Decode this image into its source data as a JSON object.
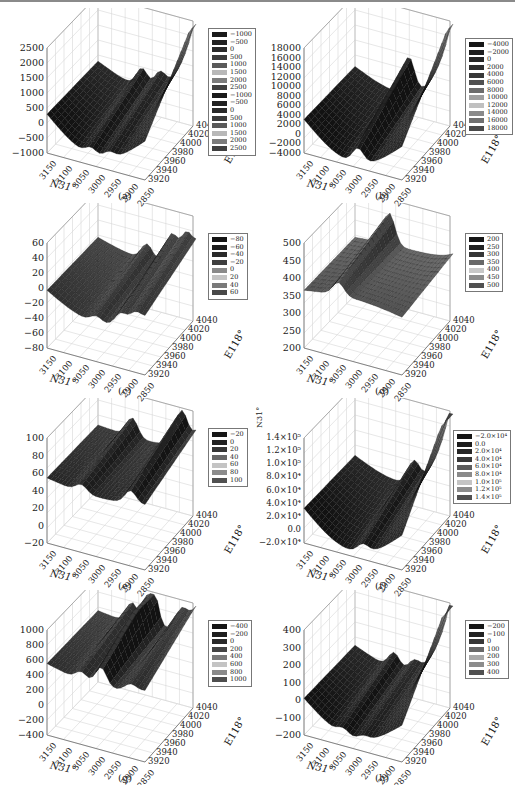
{
  "chart_data": [
    {
      "id": "a",
      "type": "surface3d",
      "caption": "(a)",
      "xlabel": "N31°",
      "ylabel": "E118°",
      "x_ticks": [
        "3150",
        "3100",
        "3050",
        "3000",
        "2950",
        "2900",
        "2850"
      ],
      "y_ticks": [
        "3920",
        "3940",
        "3960",
        "3980",
        "4000",
        "4020",
        "4040"
      ],
      "z_ticks": [
        "2500",
        "2000",
        "1500",
        "1000",
        "500",
        "0",
        "−500",
        "−1000"
      ],
      "zlim": [
        -1000,
        2500
      ],
      "legend": [
        "−1000",
        "−500",
        "0",
        "500",
        "1000",
        "1500",
        "2000",
        "2500",
        "−1000",
        "−500",
        "0",
        "500",
        "1000",
        "1500",
        "2000",
        "2500"
      ],
      "legend_colors": [
        "#1a1a1a",
        "#222222",
        "#2a2a2a",
        "#3c3c3c",
        "#5a5a5a",
        "#b8b8b8",
        "#7c7c7c",
        "#404040",
        "#1a1a1a",
        "#222222",
        "#2a2a2a",
        "#3c3c3c",
        "#5a5a5a",
        "#b8b8b8",
        "#7c7c7c",
        "#404040"
      ],
      "grid": true
    },
    {
      "id": "b",
      "type": "surface3d",
      "caption": "(b)",
      "xlabel": "N31°",
      "ylabel": "E118°",
      "x_ticks": [
        "3150",
        "3100",
        "3050",
        "3000",
        "2950",
        "2900",
        "2850"
      ],
      "y_ticks": [
        "3920",
        "3940",
        "3960",
        "3980",
        "4000",
        "4020",
        "4040"
      ],
      "z_ticks": [
        "18000",
        "16000",
        "14000",
        "12000",
        "10000",
        "8000",
        "6000",
        "4000",
        "2000",
        "0",
        "−2000",
        "−4000"
      ],
      "zlim": [
        -4000,
        18000
      ],
      "legend": [
        "−4000",
        "−2000",
        "0",
        "2000",
        "4000",
        "6000",
        "8000",
        "10000",
        "12000",
        "14000",
        "16000",
        "18000"
      ],
      "legend_colors": [
        "#161616",
        "#1e1e1e",
        "#262626",
        "#2e2e2e",
        "#383838",
        "#505050",
        "#6c6c6c",
        "#a0a0a0",
        "#c0c0c0",
        "#8a8a8a",
        "#707070",
        "#4a4a4a"
      ],
      "grid": true
    },
    {
      "id": "c",
      "type": "surface3d",
      "caption": "(c)",
      "xlabel": "N31°",
      "ylabel": "E118°",
      "x_ticks": [
        "3150",
        "3100",
        "3050",
        "3000",
        "2950",
        "2900",
        "2850"
      ],
      "y_ticks": [
        "3920",
        "3940",
        "3960",
        "3980",
        "4000",
        "4020",
        "4040"
      ],
      "z_ticks": [
        "60",
        "40",
        "20",
        "0",
        "−20",
        "−40",
        "−60",
        "−80"
      ],
      "zlim": [
        -80,
        60
      ],
      "legend": [
        "−80",
        "−60",
        "−40",
        "−20",
        "0",
        "20",
        "40",
        "60"
      ],
      "legend_colors": [
        "#141414",
        "#1e1e1e",
        "#2a2a2a",
        "#3e3e3e",
        "#8a8a8a",
        "#c4c4c4",
        "#7a7a7a",
        "#484848"
      ],
      "grid": true
    },
    {
      "id": "d",
      "type": "surface3d",
      "caption": "(d)",
      "xlabel": "N31°",
      "ylabel": "E118°",
      "x_ticks": [
        "3150",
        "3100",
        "3050",
        "3000",
        "2950",
        "2900",
        "2850"
      ],
      "y_ticks": [
        "3920",
        "3940",
        "3960",
        "3980",
        "4000",
        "4020",
        "4040"
      ],
      "z_ticks": [
        "500",
        "450",
        "400",
        "350",
        "300",
        "250",
        "200"
      ],
      "zlim": [
        200,
        500
      ],
      "legend": [
        "200",
        "250",
        "300",
        "350",
        "400",
        "450",
        "500"
      ],
      "legend_colors": [
        "#161616",
        "#222222",
        "#363636",
        "#686868",
        "#c8c8c8",
        "#8c8c8c",
        "#505050"
      ],
      "grid": true
    },
    {
      "id": "e",
      "type": "surface3d",
      "caption": "(e)",
      "xlabel": "N31°",
      "ylabel": "E118°",
      "x_ticks": [
        "3150",
        "3100",
        "3050",
        "3000",
        "2950",
        "2900",
        "2850"
      ],
      "y_ticks": [
        "3920",
        "3940",
        "3960",
        "3980",
        "4000",
        "4020",
        "4040"
      ],
      "z_ticks": [
        "100",
        "80",
        "60",
        "40",
        "20",
        "0",
        "−20"
      ],
      "zlim": [
        -20,
        100
      ],
      "legend": [
        "−20",
        "0",
        "20",
        "40",
        "60",
        "80",
        "100"
      ],
      "legend_colors": [
        "#161616",
        "#222222",
        "#363636",
        "#686868",
        "#c4c4c4",
        "#8c8c8c",
        "#505050"
      ],
      "grid": true
    },
    {
      "id": "f",
      "type": "surface3d",
      "caption": "(f)",
      "xlabel": "N31°",
      "ylabel": "E118°",
      "zlabel": "N31°",
      "x_ticks": [
        "3150",
        "3100",
        "3050",
        "3000",
        "2950",
        "2900",
        "2850"
      ],
      "y_ticks": [
        "3920",
        "3940",
        "3960",
        "3980",
        "4000",
        "4020",
        "4040"
      ],
      "z_ticks": [
        "1.4×10⁵",
        "1.2×10⁵",
        "1.0×10⁵",
        "8.0×10⁴",
        "6.0×10⁴",
        "4.0×10⁴",
        "2.0×10⁴",
        "0.0",
        "−2.0×10⁴"
      ],
      "zlim": [
        -20000,
        140000
      ],
      "legend": [
        "−2.0×10⁴",
        "0.0",
        "2.0×10⁴",
        "4.0×10⁴",
        "6.0×10⁴",
        "8.0×10⁴",
        "1.0×10⁵",
        "1.2×10⁵",
        "1.4×10⁵"
      ],
      "legend_colors": [
        "#141414",
        "#1c1c1c",
        "#262626",
        "#383838",
        "#5c5c5c",
        "#8a8a8a",
        "#c4c4c4",
        "#8c8c8c",
        "#505050"
      ],
      "grid": true
    },
    {
      "id": "g",
      "type": "surface3d",
      "caption": "(g)",
      "xlabel": "N31°",
      "ylabel": "E118°",
      "x_ticks": [
        "3150",
        "3100",
        "3050",
        "3000",
        "2950",
        "2900",
        "2850"
      ],
      "y_ticks": [
        "3920",
        "3940",
        "3960",
        "3980",
        "4000",
        "4020",
        "4040"
      ],
      "z_ticks": [
        "1000",
        "800",
        "600",
        "400",
        "200",
        "0",
        "−200",
        "−400"
      ],
      "zlim": [
        -400,
        1000
      ],
      "legend": [
        "−400",
        "−200",
        "0",
        "200",
        "400",
        "600",
        "800",
        "1000"
      ],
      "legend_colors": [
        "#141414",
        "#1e1e1e",
        "#2a2a2a",
        "#444444",
        "#7a7a7a",
        "#c4c4c4",
        "#8a8a8a",
        "#4e4e4e"
      ],
      "grid": true
    },
    {
      "id": "h",
      "type": "surface3d",
      "caption": "(h)",
      "xlabel": "N31°",
      "ylabel": "E118°",
      "x_ticks": [
        "3150",
        "3100",
        "3050",
        "3000",
        "2950",
        "2900",
        "2850"
      ],
      "y_ticks": [
        "3920",
        "3940",
        "3960",
        "3980",
        "4000",
        "4020",
        "4040"
      ],
      "z_ticks": [
        "400",
        "300",
        "200",
        "100",
        "0",
        "−100",
        "−200"
      ],
      "zlim": [
        -200,
        400
      ],
      "legend": [
        "−200",
        "−100",
        "0",
        "100",
        "200",
        "300",
        "400"
      ],
      "legend_colors": [
        "#161616",
        "#222222",
        "#363636",
        "#686868",
        "#a8a8a8",
        "#8c8c8c",
        "#505050"
      ],
      "grid": true
    }
  ]
}
